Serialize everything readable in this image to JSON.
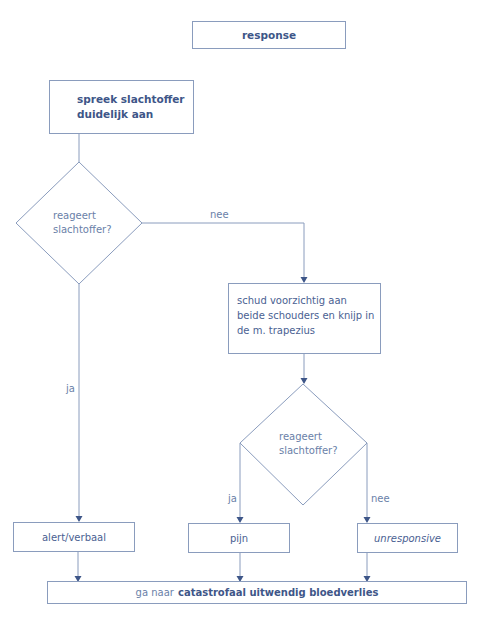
{
  "diagram": {
    "title_node": {
      "label": "response"
    },
    "nodes": {
      "step1": {
        "line1": "spreek slachtoffer",
        "line2": "duidelijk aan"
      },
      "decision1": {
        "line1": "reageert",
        "line2": "slachtoffer?"
      },
      "step2": {
        "line1": "schud voorzichtig aan",
        "line2": "beide schouders en knijp in",
        "line3": "de m. trapezius"
      },
      "decision2": {
        "line1": "reageert",
        "line2": "slachtoffer?"
      },
      "outcome_alert": {
        "label": "alert/verbaal"
      },
      "outcome_pain": {
        "label": "pijn"
      },
      "outcome_unresponsive": {
        "label": "unresponsive"
      },
      "final": {
        "prefix": "ga naar",
        "emphasis": "catastrofaal uitwendig bloedverlies"
      }
    },
    "edge_labels": {
      "d1_no": "nee",
      "d1_yes": "ja",
      "d2_yes": "ja",
      "d2_no": "nee"
    },
    "colors": {
      "line": "#8a9cbd",
      "arrow": "#3e5688",
      "text": "#4a6192",
      "bold_text": "#3e5688"
    }
  }
}
